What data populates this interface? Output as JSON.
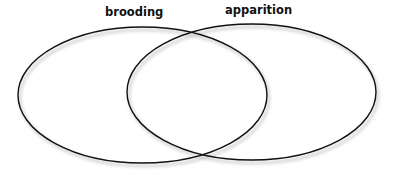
{
  "diagram": {
    "type": "venn",
    "sets": [
      {
        "id": "brooding",
        "label": "brooding"
      },
      {
        "id": "apparition",
        "label": "apparition"
      }
    ],
    "intersections": [
      {
        "sets": [
          "brooding",
          "apparition"
        ],
        "label": ""
      }
    ],
    "colors": {
      "stroke": "#111111",
      "label": "#111111",
      "background": "#ffffff",
      "shadow": "#b8b8b8"
    }
  }
}
